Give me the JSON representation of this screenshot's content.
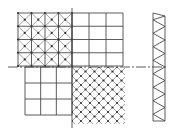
{
  "diagram": {
    "title": "",
    "colors": {
      "line": "#4a4a4a",
      "node": "#333333",
      "background": "#ffffff"
    },
    "panels": [
      {
        "id": "upper-left",
        "type": "square-grid-with-x-diagonals",
        "cols": 4,
        "rows": 4
      },
      {
        "id": "upper-right",
        "type": "square-grid",
        "cols": 3,
        "rows": 4
      },
      {
        "id": "lower-left",
        "type": "square-grid",
        "cols": 3,
        "rows": 3
      },
      {
        "id": "lower-right",
        "type": "diagonal-diamond-lattice",
        "cols": 6,
        "rows": 6
      },
      {
        "id": "side-truss",
        "type": "triangular-truss",
        "panels": 8
      }
    ],
    "axes": {
      "horizontal": "dash-dot centerline",
      "vertical": "solid divider line"
    }
  }
}
